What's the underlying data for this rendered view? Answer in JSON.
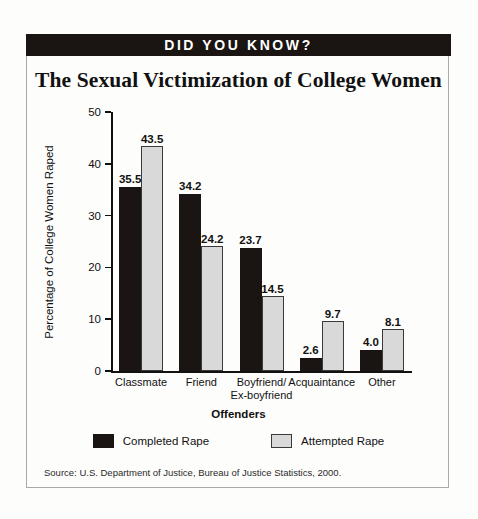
{
  "banner": {
    "text": "DID YOU KNOW?"
  },
  "chart_data": {
    "type": "bar",
    "title": "The Sexual Victimization of College Women",
    "xlabel": "Offenders",
    "ylabel": "Percentage of College Women Raped",
    "ylim": [
      0,
      50
    ],
    "yticks": [
      0,
      10,
      20,
      30,
      40,
      50
    ],
    "grid": false,
    "legend_position": "bottom",
    "categories": [
      "Classmate",
      "Friend",
      "Boyfriend/\nEx-boyfriend",
      "Acquaintance",
      "Other"
    ],
    "series": [
      {
        "name": "Completed Rape",
        "color": "#1a1512",
        "values": [
          35.5,
          34.2,
          23.7,
          2.6,
          4.0
        ],
        "labels": [
          "35.5",
          "34.2",
          "23.7",
          "2.6",
          "4.0"
        ]
      },
      {
        "name": "Attempted Rape",
        "color": "#d9d9d9",
        "values": [
          43.5,
          24.2,
          14.5,
          9.7,
          8.1
        ],
        "labels": [
          "43.5",
          "24.2",
          "14.5",
          "9.7",
          "8.1"
        ]
      }
    ],
    "source": "Source:  U.S. Department of Justice, Bureau of Justice Statistics, 2000."
  }
}
